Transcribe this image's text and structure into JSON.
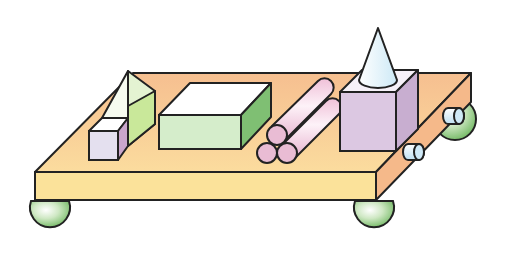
{
  "figure": {
    "colors": {
      "board_top": "#f7c89a",
      "board_front": "#fbe29a",
      "board_side": "#f5b98a",
      "outline": "#222222",
      "ball": "#8fcc7e",
      "prism_left": "#f6fbf0",
      "prism_right": "#c9e89a",
      "small_cube_front": "#e4e0ef",
      "small_cube_side": "#c9a6cc",
      "box_front": "#d5edcb",
      "box_side": "#7fbf73",
      "box_top": "#ffffff",
      "cylinder": "#f2c6dc",
      "cube_front": "#dcc8e2",
      "cube_side": "#c8aed0",
      "cube_top": "#f6f1f8",
      "cone": "#e6f4fb",
      "axle": "#cfe9f7"
    },
    "objects": [
      {
        "name": "triangular-prism",
        "shape": "triangular prism"
      },
      {
        "name": "small-cube",
        "shape": "cube"
      },
      {
        "name": "rectangular-box",
        "shape": "cuboid"
      },
      {
        "name": "cylinder-stack",
        "shape": "cylinders",
        "count": 3
      },
      {
        "name": "large-cube",
        "shape": "cube"
      },
      {
        "name": "cone",
        "shape": "cone"
      },
      {
        "name": "axle-cylinders",
        "shape": "cylinders",
        "count": 2
      },
      {
        "name": "wheels",
        "shape": "spheres",
        "count": 4
      }
    ]
  }
}
